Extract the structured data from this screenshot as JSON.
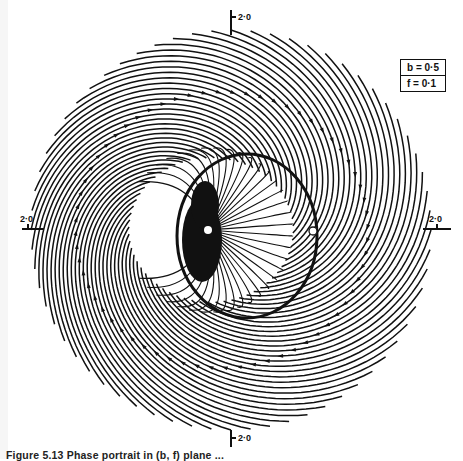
{
  "figure": {
    "type": "phase-portrait",
    "axis_labels": {
      "top": "2·0",
      "bottom": "2·0",
      "left": "2·0",
      "right": "2·0"
    },
    "legend": [
      "b = 0·5",
      "f = 0·1"
    ],
    "caption": "Figure 5.13  Phase portrait in (b, f) plane ...",
    "fixed_points": [
      {
        "kind": "stable",
        "label": "attractor",
        "x": -0.2,
        "y": 0.0
      },
      {
        "kind": "saddle",
        "label": "open-circle",
        "x": 0.78,
        "y": 0.0
      }
    ],
    "flow_direction": "counterclockwise",
    "range": {
      "x": [
        -2.0,
        2.0
      ],
      "y": [
        -2.0,
        2.0
      ]
    },
    "colors": {
      "line": "#111111",
      "background": "#ffffff"
    }
  }
}
